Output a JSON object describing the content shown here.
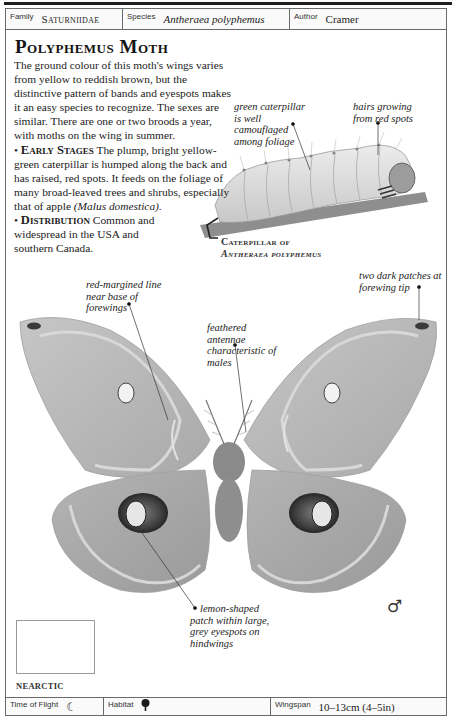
{
  "header": {
    "family_label": "Family",
    "family_value": "Saturniidae",
    "species_label": "Species",
    "species_value": "Antheraea polyphemus",
    "author_label": "Author",
    "author_value": "Cramer"
  },
  "entry": {
    "title": "Polyphemus Moth",
    "intro": "The ground colour of this moth's wings varies from yellow to reddish brown, but the distinctive pattern of bands and eyespots makes it an easy species to recognize. The sexes are similar. There are one or two broods a year, with moths on the wing in summer.",
    "early_stages_heading": "Early Stages",
    "early_stages_text": "The plump, bright yellow-green caterpillar is humped along the back and has raised, red spots. It feeds on the foliage of many broad-leaved trees and shrubs, especially that of apple",
    "early_stages_latin": "(Malus domestica).",
    "distribution_heading": "Distribution",
    "distribution_text": "Common and widespread in the USA and southern Canada.",
    "bullet": "•"
  },
  "caterpillar": {
    "callout_left": "green caterpillar is well camouflaged among foliage",
    "callout_right": "hairs growing from red spots",
    "caption_line1": "Caterpillar of",
    "caption_line2": "Antheraea polyphemus"
  },
  "moth": {
    "callout_red_margined": "red-margined line near base of forewings",
    "callout_antennae": "feathered antennae characteristic of males",
    "callout_dark_patches": "two dark patches at forewing tip",
    "callout_lemon": "lemon-shaped patch within large, grey eyespots on hindwings",
    "sex_symbol": "♂"
  },
  "map": {
    "region_label": "NEARCTIC"
  },
  "footer": {
    "time_of_flight_label": "Time of Flight",
    "time_of_flight_icon": "moon-icon",
    "habitat_label": "Habitat",
    "habitat_icon": "tree-icon",
    "wingspan_label": "Wingspan",
    "wingspan_value": "10–13cm (4–5in)"
  }
}
